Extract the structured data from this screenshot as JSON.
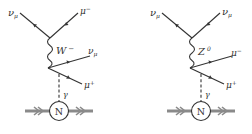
{
  "diagrams": [
    {
      "boson": "W",
      "boson_sup": "−",
      "incoming": "ν",
      "incoming_sub": "μ",
      "top_out": "μ",
      "top_out_sup": "−",
      "mid_out": "ν",
      "mid_out_sub": "μ",
      "low_out": "μ",
      "low_out_sup": "+",
      "photon": "γ",
      "nucleus": "N"
    },
    {
      "boson": "Z",
      "boson_sup": "0",
      "incoming": "ν",
      "incoming_sub": "μ",
      "top_out": "ν",
      "top_out_sub": "μ",
      "mid_out": "μ",
      "mid_out_sup": "−",
      "low_out": "μ",
      "low_out_sup": "+",
      "photon": "γ",
      "nucleus": "N"
    }
  ],
  "colors": {
    "line": "#333333",
    "nucleus_arrow": "#8a8a8a"
  }
}
